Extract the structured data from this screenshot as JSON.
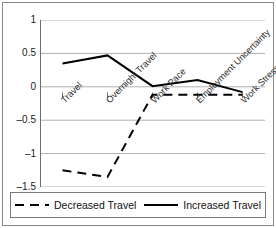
{
  "chart_data": {
    "type": "line",
    "title": "",
    "subtitle": "",
    "xlabel": "",
    "ylabel": "",
    "categories": [
      "Travel",
      "Overnight Travel",
      "Work Pace",
      "Employment Uncertainty",
      "Work Stress"
    ],
    "series": [
      {
        "name": "Decreased Travel",
        "style": "dashed",
        "color": "#000000",
        "values": [
          -1.25,
          -1.35,
          -0.12,
          -0.12,
          -0.12
        ]
      },
      {
        "name": "Increased Travel",
        "style": "solid",
        "color": "#000000",
        "values": [
          0.35,
          0.47,
          0.01,
          0.1,
          -0.08
        ]
      }
    ],
    "ylim": [
      -1.5,
      1
    ],
    "yticks": [
      1,
      0.5,
      0,
      -0.5,
      -1,
      -1.5
    ],
    "ytick_labels": [
      "1",
      "0.5",
      "0",
      "–0.5",
      "–1",
      "–1.5"
    ],
    "grid": true,
    "grid_axis": "y",
    "grid_color": "#b0b0b0",
    "legend_position": "bottom",
    "legend_entries": [
      "Decreased Travel",
      "Increased Travel"
    ],
    "axis_color": "#6e6e6e",
    "plot_background": "#ffffff"
  },
  "legend": {
    "decreased_label": "Decreased Travel",
    "increased_label": "Increased Travel"
  }
}
